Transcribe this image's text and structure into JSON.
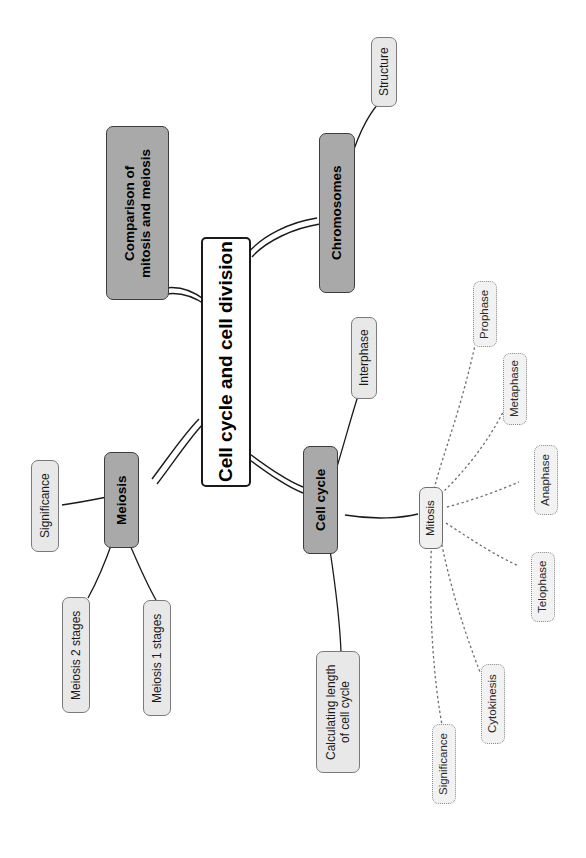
{
  "diagram": {
    "title": "Cell cycle and cell division",
    "type": "mind-map",
    "orientation": "rotated-90-clockwise",
    "colors": {
      "root_fill": "#ffffff",
      "root_stroke": "#1a1a1a",
      "level1_fill": "#a9a9a9",
      "level2_fill": "#e8e8e8",
      "dotted_fill": "#f2f2f2",
      "line": "#1a1a1a",
      "dotted_line": "#6e6e6e",
      "background": "#ffffff"
    },
    "nodes": {
      "root": "Cell cycle and cell division",
      "comparison": "Comparison of\nmitosis and meiosis",
      "chromosomes": "Chromosomes",
      "structure": "Structure",
      "cell_cycle": "Cell cycle",
      "interphase": "Interphase",
      "calculating": "Calculating length\nof cell cycle",
      "mitosis": "Mitosis",
      "prophase": "Prophase",
      "metaphase": "Metaphase",
      "anaphase": "Anaphase",
      "telophase": "Telophase",
      "cytokinesis": "Cytokinesis",
      "mitosis_significance": "Significance",
      "meiosis": "Meiosis",
      "meiosis_significance": "Significance",
      "meiosis2": "Meiosis 2 stages",
      "meiosis1": "Meiosis 1 stages"
    }
  }
}
